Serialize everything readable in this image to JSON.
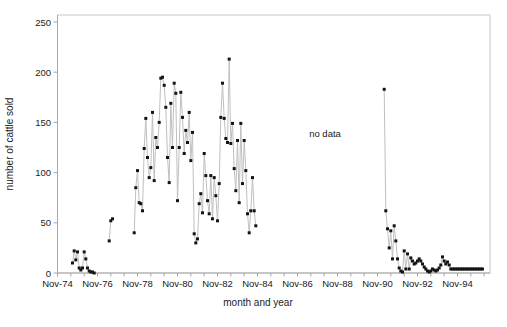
{
  "chart_data": {
    "type": "line",
    "title": "",
    "xlabel": "month and year",
    "ylabel": "number of cattle sold",
    "annotation": "no data",
    "ylim": [
      0,
      250
    ],
    "y_ticks": [
      0,
      50,
      100,
      150,
      200,
      250
    ],
    "x_axis": {
      "tick_labels": [
        "Nov-74",
        "Nov-76",
        "Nov-78",
        "Nov-80",
        "Nov-82",
        "Nov-84",
        "Nov-86",
        "Nov-88",
        "Nov-90",
        "Nov-92",
        "Nov-94"
      ],
      "months_between_labeled_ticks": 24,
      "minor_tick_every_months": 8
    },
    "legend": "none",
    "grid": "off",
    "series": [
      {
        "name": "number of cattle sold",
        "marker": "square",
        "segments": [
          {
            "start_month_index": 9,
            "values": [
              10,
              22,
              13,
              21,
              5,
              3,
              5,
              21,
              14,
              5,
              2,
              1,
              1,
              0
            ]
          },
          {
            "start_month_index": 31,
            "values": [
              32,
              52,
              54
            ]
          },
          {
            "start_month_index": 46,
            "values": [
              40,
              85,
              102,
              70,
              69,
              62,
              124,
              154,
              115,
              95,
              105,
              160,
              92,
              135,
              125,
              150,
              194,
              195,
              187,
              165,
              115,
              90,
              169,
              125,
              189,
              179,
              72,
              125,
              180,
              155,
              119,
              142,
              130,
              160,
              112,
              140,
              39,
              30,
              34,
              69,
              79,
              60,
              119,
              97,
              72,
              59,
              97,
              54,
              95,
              77,
              52,
              89,
              155,
              189,
              154,
              134,
              130,
              213,
              129,
              149,
              104,
              82,
              132,
              70,
              149,
              89,
              132,
              102,
              59,
              40,
              62,
              95,
              62,
              47
            ]
          },
          {
            "start_month_index": 196,
            "values": [
              183,
              62,
              44,
              25,
              42,
              14,
              47,
              32,
              14,
              5,
              2,
              1,
              22,
              4,
              19,
              4,
              15,
              12,
              9,
              10,
              12,
              14,
              12,
              9,
              6,
              4,
              2,
              1,
              2,
              4,
              3,
              2,
              3,
              5,
              8,
              16,
              12,
              9,
              11,
              8,
              4,
              4,
              4,
              4,
              4,
              4,
              4,
              4,
              4,
              4,
              4,
              4,
              4,
              4,
              4,
              4,
              4,
              4,
              4,
              4
            ]
          }
        ]
      }
    ]
  },
  "colors": {
    "marker": "#141414",
    "line": "#c0c0c0",
    "axis": "#a8a8a8",
    "frame": "#c9c9c9",
    "text": "#1a1a1a",
    "background": "#ffffff"
  }
}
